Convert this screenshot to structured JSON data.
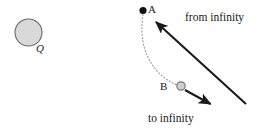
{
  "figure": {
    "width": 259,
    "height": 130,
    "background": "#ffffff"
  },
  "labels": {
    "charge_Q": "Q",
    "point_A": "A",
    "point_B": "B",
    "from_infinity": "from infinity",
    "to_infinity": "to infinity"
  },
  "colors": {
    "stroke": "#1a1a1a",
    "text": "#1a1a1a",
    "charge_fill": "#d9d9d9",
    "charge_stroke": "#6b6b6b",
    "point_a_fill": "#111111",
    "point_b_fill": "#cfcfcf",
    "point_b_stroke": "#7a7a7a",
    "trajectory": "#9a9a9a",
    "background": "#ffffff"
  },
  "geometry": {
    "charge_circle": {
      "cx": 28.5,
      "cy": 32.5,
      "r": 13.5
    },
    "point_a": {
      "cx": 143,
      "cy": 10.5,
      "r": 3.6
    },
    "point_b": {
      "cx": 181,
      "cy": 86,
      "r": 4.2
    },
    "incoming_arrow": {
      "x1": 246,
      "y1": 104,
      "x2": 155,
      "y2": 21
    },
    "outgoing_arrow": {
      "x1": 185,
      "y1": 90,
      "x2": 212,
      "y2": 105
    },
    "trajectory_path": "M 143 14.5 C 140 34 142 56 160 74 C 168 81 174 84 178.5 85.5"
  }
}
